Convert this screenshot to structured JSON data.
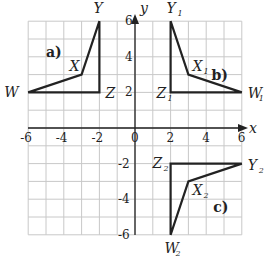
{
  "axes": {
    "x_label": "x",
    "y_label": "y",
    "x_ticks": [
      "-6",
      "-4",
      "-2",
      "0",
      "2",
      "4",
      "6"
    ],
    "y_ticks": [
      "6",
      "4",
      "2",
      "-2",
      "-4",
      "-6"
    ],
    "range": {
      "xmin": -6,
      "xmax": 6,
      "ymin": -6,
      "ymax": 6
    },
    "grid_step": 1
  },
  "shapes": [
    {
      "panel_label": "a)",
      "points": [
        {
          "name": "W",
          "sub": "",
          "x": -6,
          "y": 2
        },
        {
          "name": "X",
          "sub": "",
          "x": -3,
          "y": 3
        },
        {
          "name": "Y",
          "sub": "",
          "x": -2,
          "y": 6
        },
        {
          "name": "Z",
          "sub": "",
          "x": -2,
          "y": 2
        }
      ]
    },
    {
      "panel_label": "b)",
      "points": [
        {
          "name": "W",
          "sub": "1",
          "x": 6,
          "y": 2
        },
        {
          "name": "X",
          "sub": "1",
          "x": 3,
          "y": 3
        },
        {
          "name": "Y",
          "sub": "1",
          "x": 2,
          "y": 6
        },
        {
          "name": "Z",
          "sub": "1",
          "x": 2,
          "y": 2
        }
      ]
    },
    {
      "panel_label": "c)",
      "points": [
        {
          "name": "W",
          "sub": "2",
          "x": 2,
          "y": -6
        },
        {
          "name": "X",
          "sub": "2",
          "x": 3,
          "y": -3
        },
        {
          "name": "Y",
          "sub": "2",
          "x": 6,
          "y": -2
        },
        {
          "name": "Z",
          "sub": "2",
          "x": 2,
          "y": -2
        }
      ]
    }
  ],
  "colors": {
    "grid": "#c8c8c8",
    "ink": "#222222",
    "background": "#ffffff"
  }
}
